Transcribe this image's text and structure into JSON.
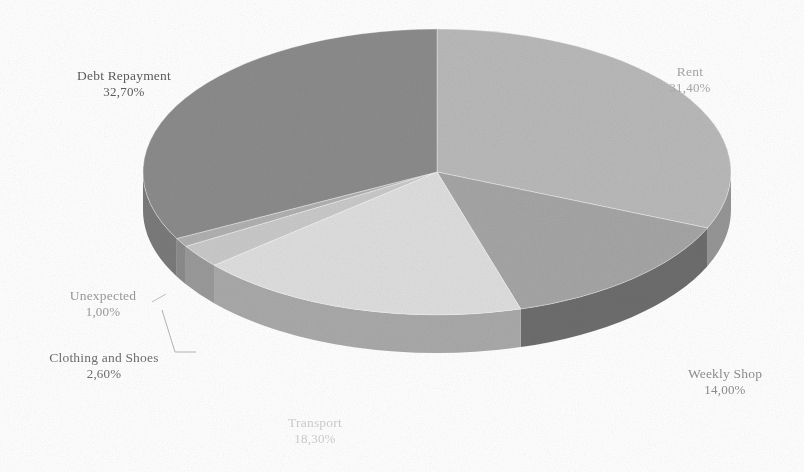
{
  "chart_data": {
    "type": "pie",
    "title": "",
    "subtitle": "",
    "xlabel": "",
    "ylabel": "",
    "legend_position": "none",
    "grid": false,
    "style": "3d-pie-grayscale",
    "value_suffix": "%",
    "decimal_separator": ",",
    "categories": [
      "Rent",
      "Weekly Shop",
      "Transport",
      "Clothing and Shoes",
      "Unexpected",
      "Debt Repayment"
    ],
    "values": [
      31.4,
      14.0,
      18.3,
      2.6,
      1.0,
      32.7
    ],
    "value_labels": [
      "31,40%",
      "14,00%",
      "18,30%",
      "2,60%",
      "1,00%",
      "32,70%"
    ],
    "total": 100.0,
    "slices": [
      {
        "name": "Rent",
        "value": 31.4,
        "value_label": "31,40%",
        "top_color": "#b9b9b9",
        "side_color": "#969696",
        "label_color": "#a8a8a8"
      },
      {
        "name": "Weekly Shop",
        "value": 14.0,
        "value_label": "14,00%",
        "top_color": "#a5a5a5",
        "side_color": "#6d6d6d",
        "label_color": "#8f8f8f"
      },
      {
        "name": "Transport",
        "value": 18.3,
        "value_label": "18,30%",
        "top_color": "#dedede",
        "side_color": "#a9a9a9",
        "label_color": "#cfcfcf"
      },
      {
        "name": "Clothing and Shoes",
        "value": 2.6,
        "value_label": "2,60%",
        "top_color": "#c9c9c9",
        "side_color": "#9a9a9a",
        "label_color": "#6f6f6f"
      },
      {
        "name": "Unexpected",
        "value": 1.0,
        "value_label": "1,00%",
        "top_color": "#b0b0b0",
        "side_color": "#8b8b8b",
        "label_color": "#9b9b9b"
      },
      {
        "name": "Debt Repayment",
        "value": 32.7,
        "value_label": "32,70%",
        "top_color": "#8b8b8b",
        "side_color": "#7a7a7a",
        "label_color": "#5d5d5d"
      }
    ]
  },
  "background_color": "#ffffff",
  "labels": {
    "debt": {
      "name": "Debt Repayment",
      "value": "32,70%"
    },
    "rent": {
      "name": "Rent",
      "value": "31,40%"
    },
    "weekly": {
      "name": "Weekly Shop",
      "value": "14,00%"
    },
    "transport": {
      "name": "Transport",
      "value": "18,30%"
    },
    "clothing": {
      "name": "Clothing and Shoes",
      "value": "2,60%"
    },
    "unexpected": {
      "name": "Unexpected",
      "value": "1,00%"
    }
  }
}
